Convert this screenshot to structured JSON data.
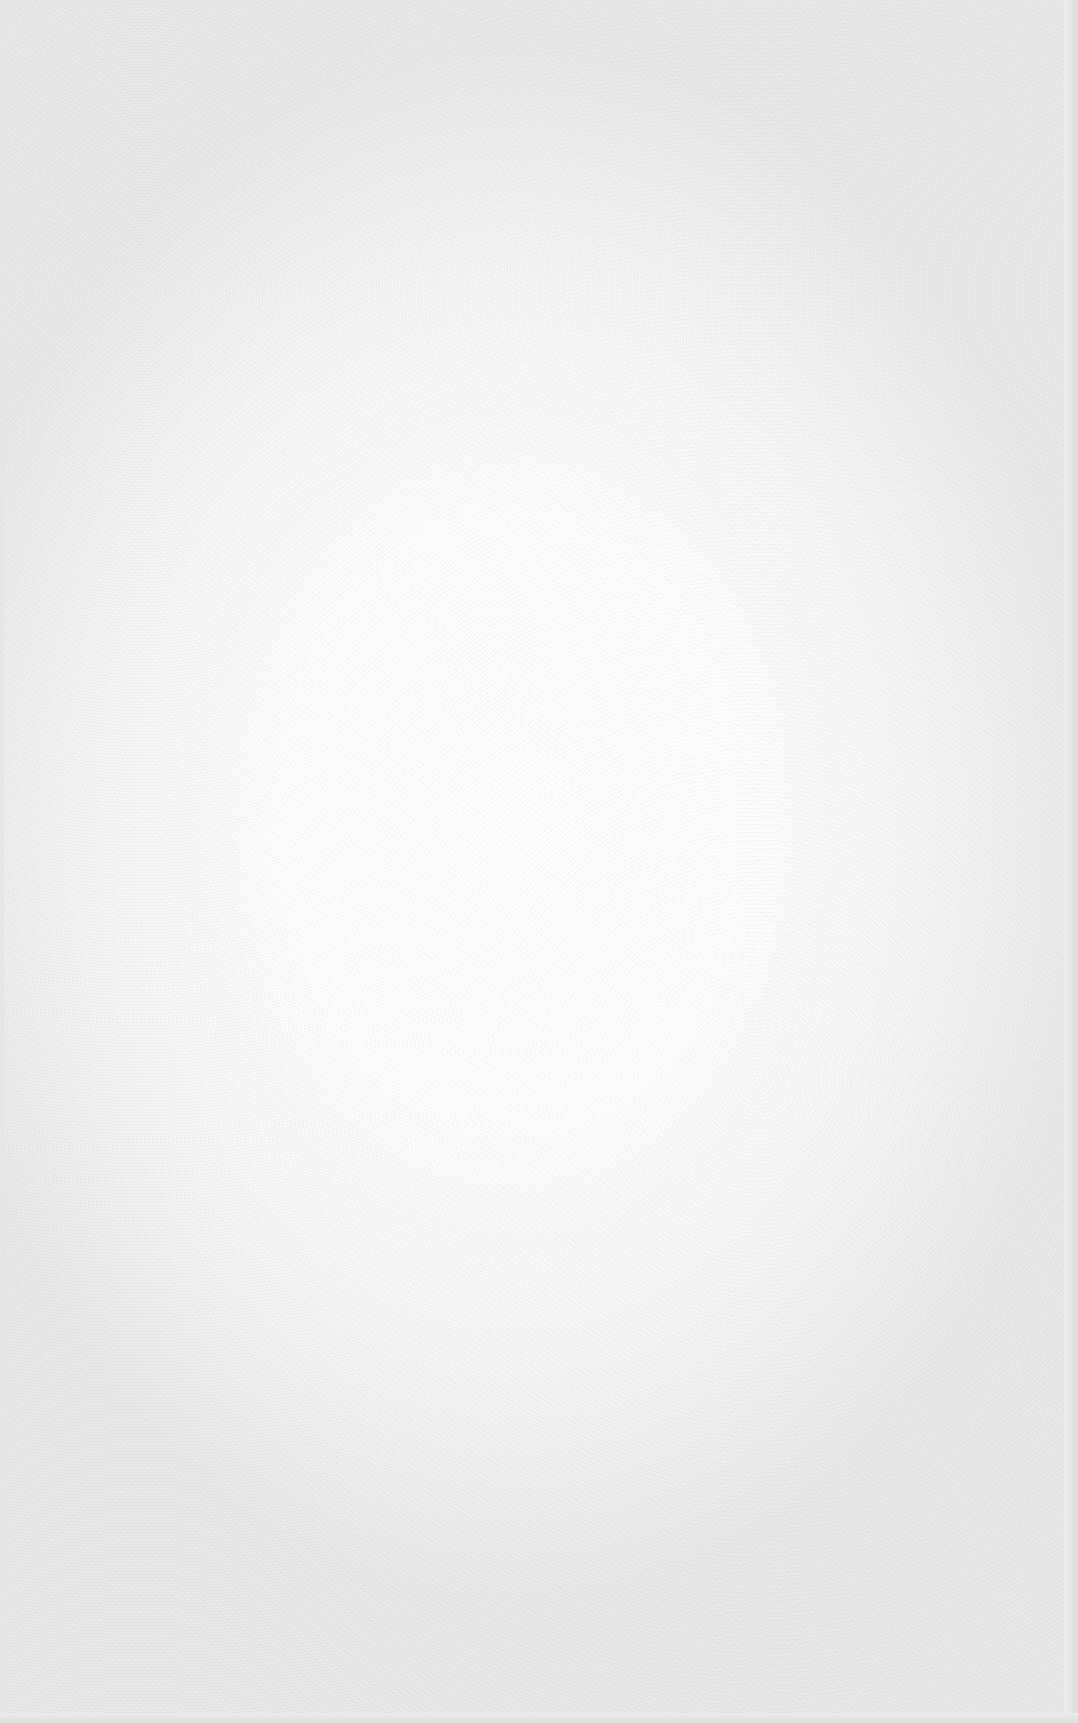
{
  "page": {
    "text": ""
  },
  "colors": {
    "paper_center": "#ffffff",
    "paper_edge": "#e9e9e9",
    "border": "#dcdcdc"
  }
}
